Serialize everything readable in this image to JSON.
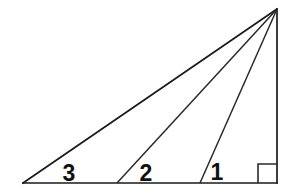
{
  "figure": {
    "background_color": "#ffffff",
    "stroke_color": "#1a1a1a",
    "label_color": "#111111",
    "canvas": {
      "width": 291,
      "height": 195
    },
    "vertices": {
      "bottom_left": {
        "x": 23,
        "y": 183
      },
      "bottom_right": {
        "x": 277,
        "y": 183
      },
      "apex": {
        "x": 277,
        "y": 9
      }
    },
    "base_points": [
      {
        "name": "vertex-3",
        "x": 23,
        "y": 183
      },
      {
        "name": "cevian-foot-2",
        "x": 117,
        "y": 183
      },
      {
        "name": "cevian-foot-1",
        "x": 200,
        "y": 183
      },
      {
        "name": "vertex-right-angle",
        "x": 277,
        "y": 183
      }
    ],
    "segments": [
      {
        "name": "base",
        "x1": 23,
        "y1": 183,
        "x2": 277,
        "y2": 183
      },
      {
        "name": "right-side-vertical",
        "x1": 277,
        "y1": 183,
        "x2": 277,
        "y2": 9
      },
      {
        "name": "hypotenuse",
        "x1": 23,
        "y1": 183,
        "x2": 277,
        "y2": 9
      },
      {
        "name": "cevian-middle",
        "x1": 117,
        "y1": 183,
        "x2": 277,
        "y2": 9
      },
      {
        "name": "cevian-inner",
        "x1": 200,
        "y1": 183,
        "x2": 277,
        "y2": 9
      }
    ],
    "right_angle_marker": {
      "name": "right-angle-square",
      "x": 258,
      "y": 164,
      "size": 19
    },
    "labels": [
      {
        "id": "angle-3",
        "text": "3",
        "x": 69,
        "y": 181
      },
      {
        "id": "angle-2",
        "text": "2",
        "x": 146,
        "y": 181
      },
      {
        "id": "angle-1",
        "text": "1",
        "x": 217,
        "y": 180
      }
    ]
  }
}
